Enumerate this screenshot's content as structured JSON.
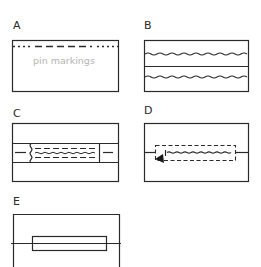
{
  "figure": {
    "colors": {
      "line": "#2a2a2a",
      "annotation": "#b4b4b4",
      "background": "#ffffff"
    }
  },
  "panels": [
    {
      "id": "A",
      "label": "A",
      "annotation": "pin markings",
      "elements": [
        "rectangle",
        "dash-dot pin-marking line"
      ]
    },
    {
      "id": "B",
      "label": "B",
      "elements": [
        "rectangle",
        "horizontal divider",
        "two wavy stitch lines"
      ]
    },
    {
      "id": "C",
      "label": "C",
      "elements": [
        "rectangle",
        "two horizontal lines",
        "wavy left edge",
        "dashed stitching",
        "wavy stitch line",
        "vertical end line",
        "short side dashes"
      ]
    },
    {
      "id": "D",
      "label": "D",
      "elements": [
        "rectangle",
        "horizontal line",
        "dashed rectangle",
        "wavy stitch line",
        "arrow pointing left"
      ]
    },
    {
      "id": "E",
      "label": "E",
      "elements": [
        "rectangle",
        "horizontal line",
        "inner rectangle"
      ]
    }
  ]
}
